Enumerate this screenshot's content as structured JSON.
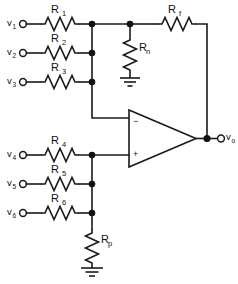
{
  "figure": {
    "background_color": "#ffffff",
    "line_color": "#1a1a1a"
  },
  "inputs": [
    {
      "name": "v1",
      "label": "v",
      "subscript": "1",
      "resistor": "R",
      "resistor_subscript": "1",
      "rail": "inverting"
    },
    {
      "name": "v2",
      "label": "v",
      "subscript": "2",
      "resistor": "R",
      "resistor_subscript": "2",
      "rail": "inverting"
    },
    {
      "name": "v3",
      "label": "v",
      "subscript": "3",
      "resistor": "R",
      "resistor_subscript": "3",
      "rail": "inverting"
    },
    {
      "name": "v4",
      "label": "v",
      "subscript": "4",
      "resistor": "R",
      "resistor_subscript": "4",
      "rail": "noninverting"
    },
    {
      "name": "v5",
      "label": "v",
      "subscript": "5",
      "resistor": "R",
      "resistor_subscript": "5",
      "rail": "noninverting"
    },
    {
      "name": "v6",
      "label": "v",
      "subscript": "6",
      "resistor": "R",
      "resistor_subscript": "6",
      "rail": "noninverting"
    }
  ],
  "components": {
    "feedback_resistor": {
      "label": "R",
      "subscript": "f"
    },
    "inverting_shunt_resistor": {
      "label": "R",
      "subscript": "n"
    },
    "noninverting_shunt_resistor": {
      "label": "R",
      "subscript": "p"
    }
  },
  "opamp": {
    "inverting_sign": "−",
    "noninverting_sign": "+"
  },
  "output": {
    "label": "v",
    "subscript": "o"
  },
  "ground_symbols": [
    {
      "name": "ground-rn"
    },
    {
      "name": "ground-rp"
    }
  ]
}
